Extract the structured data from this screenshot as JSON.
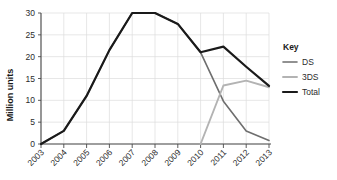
{
  "chart_data": {
    "type": "line",
    "title": "",
    "xlabel": "",
    "ylabel": "Million units",
    "categories": [
      "2003",
      "2004",
      "2005",
      "2006",
      "2007",
      "2008",
      "2009",
      "2010",
      "2011",
      "2012",
      "2013"
    ],
    "x": [
      2003,
      2004,
      2005,
      2006,
      2007,
      2008,
      2009,
      2010,
      2011,
      2012,
      2013
    ],
    "ylim": [
      0,
      30
    ],
    "yticks": [
      0,
      5,
      10,
      15,
      20,
      25,
      30
    ],
    "ytick_labels": [
      "0",
      "5",
      "10",
      "15",
      "20",
      "25",
      "30"
    ],
    "grid": true,
    "legend_position": "right",
    "legend_title": "Key",
    "series": [
      {
        "name": "DS",
        "color": "#6e6e6e",
        "values": [
          0,
          3,
          11,
          21.5,
          30,
          30,
          27.5,
          21,
          9.8,
          3,
          0.8
        ]
      },
      {
        "name": "3DS",
        "color": "#b3b3b3",
        "values": [
          null,
          null,
          null,
          null,
          null,
          null,
          null,
          0,
          13.4,
          14.5,
          13
        ]
      },
      {
        "name": "Total",
        "color": "#1a1a1a",
        "values": [
          0,
          3,
          11,
          21.5,
          30,
          30,
          27.5,
          21,
          22.3,
          17.7,
          13.3
        ]
      }
    ]
  },
  "legend": {
    "title": "Key",
    "entries": [
      {
        "label": "DS",
        "color": "#6e6e6e"
      },
      {
        "label": "3DS",
        "color": "#b3b3b3"
      },
      {
        "label": "Total",
        "color": "#1a1a1a"
      }
    ]
  },
  "axes": {
    "y_title": "Million units",
    "y_tick_labels": [
      "0",
      "5",
      "10",
      "15",
      "20",
      "25",
      "30"
    ],
    "x_tick_labels": [
      "2003",
      "2004",
      "2005",
      "2006",
      "2007",
      "2008",
      "2009",
      "2010",
      "2011",
      "2012",
      "2013"
    ]
  },
  "colors": {
    "background": "#ffffff",
    "grid": "#dcdcdc",
    "axis": "#4a4a4a",
    "text": "#2b2b2b",
    "ds": "#6e6e6e",
    "tds": "#b3b3b3",
    "total": "#1a1a1a"
  }
}
